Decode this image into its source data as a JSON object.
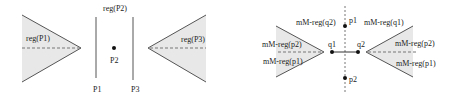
{
  "left_diagram": {
    "regions": {
      "left": "reg(P1)",
      "top": "reg(P2)",
      "right": "reg(P3)"
    },
    "points": {
      "center": "P2"
    },
    "lines": {
      "left": "P1",
      "right": "P3"
    }
  },
  "right_diagram": {
    "labels": {
      "top_left": "mM-reg(q2)",
      "top_right": "mM-reg(q1)",
      "left_upper": "mM-reg(p2)",
      "left_lower": "mM-reg(p1)",
      "right_upper": "mM-reg(p2)",
      "right_lower": "mM-reg(p1)"
    },
    "points": {
      "p1": "p1",
      "p2": "p2",
      "q1": "q1",
      "q2": "q2"
    }
  },
  "colors": {
    "fill": "#e8e8e8",
    "stroke": "#555555",
    "dashed": "#777777"
  }
}
